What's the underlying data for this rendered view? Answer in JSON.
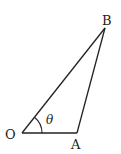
{
  "diagram": {
    "type": "triangle",
    "vertices": [
      {
        "label": "O",
        "x": 22,
        "y": 133
      },
      {
        "label": "A",
        "x": 77,
        "y": 133
      },
      {
        "label": "B",
        "x": 105,
        "y": 28
      }
    ],
    "angle": {
      "vertex": "O",
      "label": "θ"
    },
    "stroke_color": "#222222"
  },
  "labels": {
    "O": "O",
    "A": "A",
    "B": "B",
    "theta": "θ"
  }
}
